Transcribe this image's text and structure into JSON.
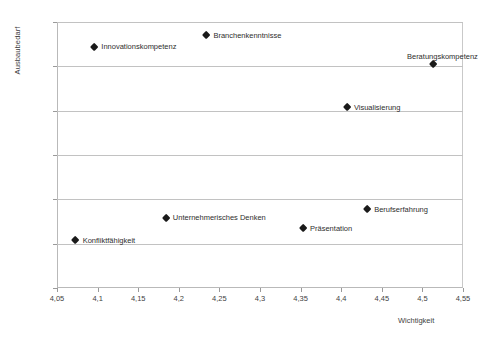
{
  "chart_data": {
    "type": "scatter",
    "title": "",
    "xlabel": "Wichtigkeit",
    "ylabel": "Ausbaubedarf",
    "xlim": [
      4.05,
      4.55
    ],
    "ylim": [
      20,
      50
    ],
    "grid": true,
    "legend": "none",
    "x_ticks": [
      "4,05",
      "4,1",
      "4,15",
      "4,2",
      "4,25",
      "4,3",
      "4,35",
      "4,4",
      "4,45",
      "4,5",
      "4,55"
    ],
    "x_tick_values": [
      4.05,
      4.1,
      4.15,
      4.2,
      4.25,
      4.3,
      4.35,
      4.4,
      4.45,
      4.5,
      4.55
    ],
    "y_ticks": [
      "20%",
      "25%",
      "30%",
      "35%",
      "40%",
      "45%",
      "50%"
    ],
    "y_tick_values": [
      20,
      25,
      30,
      35,
      40,
      45,
      50
    ],
    "points": [
      {
        "label": "Innovationskompetenz",
        "x": 4.096,
        "y": 47.2,
        "label_pos": "right"
      },
      {
        "label": "Branchenkenntnisse",
        "x": 4.234,
        "y": 48.5,
        "label_pos": "right"
      },
      {
        "label": "Beratungskompetenz",
        "x": 4.513,
        "y": 45.2,
        "label_pos": "above"
      },
      {
        "label": "Visualisierung",
        "x": 4.407,
        "y": 40.4,
        "label_pos": "right"
      },
      {
        "label": "Berufserfahrung",
        "x": 4.432,
        "y": 28.9,
        "label_pos": "right"
      },
      {
        "label": "Unternehmerisches Denken",
        "x": 4.184,
        "y": 27.9,
        "label_pos": "right"
      },
      {
        "label": "Präsentation",
        "x": 4.353,
        "y": 26.7,
        "label_pos": "right"
      },
      {
        "label": "Konfliktfähigkeit",
        "x": 4.073,
        "y": 25.4,
        "label_pos": "right"
      }
    ],
    "marker_color": "#1a1a1a",
    "grid_color": "#c2c2c2",
    "axis_color": "#b9b9b9"
  }
}
